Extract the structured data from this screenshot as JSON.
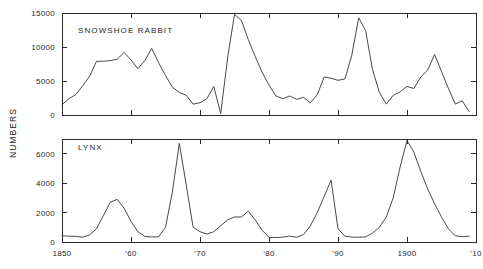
{
  "chart_data": {
    "type": "line",
    "title": "",
    "xlabel": "",
    "ylabel": "NUMBERS",
    "grid": false,
    "legend": "none",
    "panels": [
      {
        "name": "SNOWSHOE RABBIT",
        "ylim": [
          0,
          15000
        ],
        "yticks": [
          0,
          5000,
          10000,
          15000
        ],
        "ytick_labels": [
          "0",
          "5000",
          "10000",
          "15000"
        ],
        "x": [
          1850,
          1851,
          1852,
          1853,
          1854,
          1855,
          1856,
          1857,
          1858,
          1859,
          1860,
          1861,
          1862,
          1863,
          1864,
          1865,
          1866,
          1867,
          1868,
          1869,
          1870,
          1871,
          1872,
          1873,
          1874,
          1875,
          1876,
          1877,
          1878,
          1879,
          1880,
          1881,
          1882,
          1883,
          1884,
          1885,
          1886,
          1887,
          1888,
          1889,
          1890,
          1891,
          1892,
          1893,
          1894,
          1895,
          1896,
          1897,
          1898,
          1899,
          1900,
          1901,
          1902,
          1903,
          1904,
          1905,
          1906,
          1907,
          1908,
          1909
        ],
        "values": [
          1500,
          2400,
          3000,
          4300,
          5700,
          7900,
          7900,
          8000,
          8200,
          9200,
          8100,
          6800,
          8000,
          9800,
          7700,
          5800,
          4100,
          3300,
          2900,
          1600,
          1800,
          2400,
          4200,
          200,
          8400,
          14800,
          13900,
          11100,
          8600,
          6300,
          4400,
          2800,
          2400,
          2800,
          2300,
          2600,
          1800,
          3000,
          5600,
          5400,
          5100,
          5300,
          8800,
          14300,
          12400,
          6700,
          3300,
          1600,
          2900,
          3400,
          4200,
          3900,
          5600,
          6600,
          8900,
          6400,
          3900,
          1600,
          2100,
          500
        ]
      },
      {
        "name": "LYNX",
        "ylim": [
          0,
          7000
        ],
        "yticks": [
          0,
          2000,
          4000,
          6000
        ],
        "ytick_labels": [
          "0",
          "2000",
          "4000",
          "6000"
        ],
        "x": [
          1850,
          1851,
          1852,
          1853,
          1854,
          1855,
          1856,
          1857,
          1858,
          1859,
          1860,
          1861,
          1862,
          1863,
          1864,
          1865,
          1866,
          1867,
          1868,
          1869,
          1870,
          1871,
          1872,
          1873,
          1874,
          1875,
          1876,
          1877,
          1878,
          1879,
          1880,
          1881,
          1882,
          1883,
          1884,
          1885,
          1886,
          1887,
          1888,
          1889,
          1890,
          1891,
          1892,
          1893,
          1894,
          1895,
          1896,
          1897,
          1898,
          1899,
          1900,
          1901,
          1902,
          1903,
          1904,
          1905,
          1906,
          1907,
          1908,
          1909
        ],
        "values": [
          420,
          400,
          380,
          330,
          480,
          900,
          1800,
          2700,
          2900,
          2300,
          1400,
          700,
          380,
          340,
          350,
          1000,
          3400,
          6700,
          3900,
          1000,
          700,
          540,
          700,
          1100,
          1500,
          1700,
          1700,
          2100,
          1500,
          800,
          320,
          300,
          330,
          400,
          320,
          500,
          1100,
          2000,
          3100,
          4200,
          900,
          400,
          340,
          320,
          350,
          600,
          1000,
          1700,
          3000,
          5100,
          6900,
          6100,
          4800,
          3600,
          2600,
          1700,
          900,
          420,
          360,
          400
        ]
      }
    ],
    "xticks": [
      1850,
      1860,
      1870,
      1880,
      1890,
      1900,
      1910
    ],
    "xtick_labels": [
      "1850",
      "'60",
      "'70",
      "'80",
      "'90",
      "1900",
      "'10"
    ],
    "xlim": [
      1850,
      1910
    ]
  },
  "figure": {
    "background_color": "#ffffff",
    "line_color": "#333333",
    "axis_color": "#2b2b2b"
  }
}
